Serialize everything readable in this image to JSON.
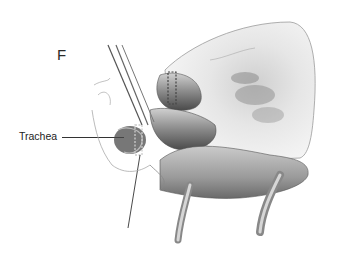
{
  "figure": {
    "panel_letter": "F",
    "labels": [
      {
        "text": "Trachea",
        "target": "trachea"
      }
    ]
  },
  "colors": {
    "background": "#ffffff",
    "ink": "#2a2a2a",
    "tissue_light": "#e4e4e4",
    "tissue_mid": "#a8a8a8",
    "tissue_dark": "#5a5a5a"
  }
}
